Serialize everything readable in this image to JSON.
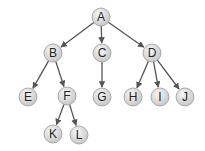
{
  "diagram": {
    "type": "tree",
    "colors": {
      "edge": "#555555",
      "node_fill_center": "#f4f4f4",
      "node_fill_edge": "#c8c8c8",
      "node_stroke": "#9a9a9a",
      "label": "#222222"
    },
    "nodes": [
      {
        "id": "A",
        "label": "A",
        "x": 101,
        "y": 17
      },
      {
        "id": "B",
        "label": "B",
        "x": 53,
        "y": 53
      },
      {
        "id": "C",
        "label": "C",
        "x": 102,
        "y": 53
      },
      {
        "id": "D",
        "label": "D",
        "x": 152,
        "y": 53
      },
      {
        "id": "E",
        "label": "E",
        "x": 28,
        "y": 97
      },
      {
        "id": "F",
        "label": "F",
        "x": 67,
        "y": 96
      },
      {
        "id": "G",
        "label": "G",
        "x": 102,
        "y": 97
      },
      {
        "id": "H",
        "label": "H",
        "x": 133,
        "y": 97
      },
      {
        "id": "I",
        "label": "I",
        "x": 160,
        "y": 97
      },
      {
        "id": "J",
        "label": "J",
        "x": 185,
        "y": 97
      },
      {
        "id": "K",
        "label": "K",
        "x": 53,
        "y": 134
      },
      {
        "id": "L",
        "label": "L",
        "x": 79,
        "y": 135
      }
    ],
    "edges": [
      {
        "from": "A",
        "to": "B"
      },
      {
        "from": "A",
        "to": "C"
      },
      {
        "from": "A",
        "to": "D"
      },
      {
        "from": "B",
        "to": "E"
      },
      {
        "from": "B",
        "to": "F"
      },
      {
        "from": "C",
        "to": "G"
      },
      {
        "from": "D",
        "to": "H"
      },
      {
        "from": "D",
        "to": "I"
      },
      {
        "from": "D",
        "to": "J"
      },
      {
        "from": "F",
        "to": "K"
      },
      {
        "from": "F",
        "to": "L"
      }
    ]
  }
}
